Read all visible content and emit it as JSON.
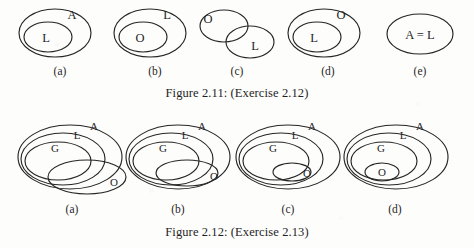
{
  "page": {
    "background_color": "#fdfdfc",
    "ink_color": "#262626"
  },
  "figures": [
    {
      "id": "figure-2-11",
      "caption": "Figure 2.11: (Exercise 2.12)",
      "panels": [
        {
          "label": "(a)",
          "label_x": 60,
          "description": "L inside A",
          "sets": [
            {
              "name": "A",
              "text": "A",
              "cx": 55,
              "cy": 33,
              "rx": 36,
              "ry": 24,
              "label_x": 72,
              "label_y": 19
            },
            {
              "name": "L",
              "text": "L",
              "cx": 48,
              "cy": 37,
              "rx": 24,
              "ry": 15,
              "label_x": 46,
              "label_y": 42
            }
          ]
        },
        {
          "label": "(b)",
          "label_x": 155,
          "description": "O inside L",
          "sets": [
            {
              "name": "L",
              "text": "L",
              "cx": 150,
              "cy": 33,
              "rx": 36,
              "ry": 24,
              "label_x": 167,
              "label_y": 19
            },
            {
              "name": "O",
              "text": "O",
              "cx": 143,
              "cy": 37,
              "rx": 24,
              "ry": 15,
              "label_x": 140,
              "label_y": 42
            }
          ]
        },
        {
          "label": "(c)",
          "label_x": 237,
          "description": "O and L overlapping",
          "sets": [
            {
              "name": "O",
              "text": "O",
              "cx": 224,
              "cy": 26,
              "rx": 24,
              "ry": 16,
              "label_x": 208,
              "label_y": 23
            },
            {
              "name": "L",
              "text": "L",
              "cx": 250,
              "cy": 42,
              "rx": 24,
              "ry": 16,
              "label_x": 255,
              "label_y": 50
            }
          ]
        },
        {
          "label": "(d)",
          "label_x": 328,
          "description": "L inside O",
          "sets": [
            {
              "name": "O",
              "text": "O",
              "cx": 324,
              "cy": 33,
              "rx": 36,
              "ry": 24,
              "label_x": 341,
              "label_y": 19
            },
            {
              "name": "L",
              "text": "L",
              "cx": 317,
              "cy": 37,
              "rx": 24,
              "ry": 15,
              "label_x": 314,
              "label_y": 42
            }
          ]
        },
        {
          "label": "(e)",
          "label_x": 420,
          "description": "single set labelled A = L",
          "sets": [
            {
              "name": "A=L",
              "text": "A = L",
              "cx": 420,
              "cy": 34,
              "rx": 33,
              "ry": 20,
              "label_x": 420,
              "label_y": 39
            }
          ]
        }
      ]
    },
    {
      "id": "figure-2-12",
      "caption": "Figure 2.12: (Exercise 2.13)",
      "panels": [
        {
          "label": "(a)",
          "label_x": 72,
          "description": "G inside L inside A; O overlaps all and extends outside A",
          "sets": [
            {
              "name": "A",
              "text": "A",
              "cx": 70,
              "cy": 157,
              "rx": 52,
              "ry": 32,
              "label_x": 94,
              "label_y": 130
            },
            {
              "name": "L",
              "text": "L",
              "cx": 63,
              "cy": 159,
              "rx": 42,
              "ry": 26,
              "label_x": 77,
              "label_y": 139
            },
            {
              "name": "G",
              "text": "G",
              "cx": 58,
              "cy": 161,
              "rx": 33,
              "ry": 19,
              "label_x": 55,
              "label_y": 152
            },
            {
              "name": "O",
              "text": "O",
              "cx": 87,
              "cy": 177,
              "rx": 39,
              "ry": 17,
              "label_x": 114,
              "label_y": 186
            }
          ]
        },
        {
          "label": "(b)",
          "label_x": 178,
          "description": "G inside L inside A; O inside A overlapping L and G",
          "sets": [
            {
              "name": "A",
              "text": "A",
              "cx": 178,
              "cy": 157,
              "rx": 52,
              "ry": 32,
              "label_x": 202,
              "label_y": 130
            },
            {
              "name": "L",
              "text": "L",
              "cx": 171,
              "cy": 159,
              "rx": 42,
              "ry": 26,
              "label_x": 185,
              "label_y": 139
            },
            {
              "name": "G",
              "text": "G",
              "cx": 166,
              "cy": 161,
              "rx": 33,
              "ry": 19,
              "label_x": 163,
              "label_y": 152
            },
            {
              "name": "O",
              "text": "O",
              "cx": 187,
              "cy": 173,
              "rx": 31,
              "ry": 13,
              "label_x": 214,
              "label_y": 180
            }
          ]
        },
        {
          "label": "(c)",
          "label_x": 288,
          "description": "G inside L inside A; O inside L overlapping G",
          "sets": [
            {
              "name": "A",
              "text": "A",
              "cx": 288,
              "cy": 157,
              "rx": 52,
              "ry": 32,
              "label_x": 312,
              "label_y": 130
            },
            {
              "name": "L",
              "text": "L",
              "cx": 281,
              "cy": 159,
              "rx": 42,
              "ry": 26,
              "label_x": 295,
              "label_y": 139
            },
            {
              "name": "G",
              "text": "G",
              "cx": 276,
              "cy": 161,
              "rx": 33,
              "ry": 19,
              "label_x": 273,
              "label_y": 152
            },
            {
              "name": "O",
              "text": "O",
              "cx": 292,
              "cy": 172,
              "rx": 19,
              "ry": 9,
              "label_x": 307,
              "label_y": 177
            }
          ]
        },
        {
          "label": "(d)",
          "label_x": 395,
          "description": "O inside G inside L inside A",
          "sets": [
            {
              "name": "A",
              "text": "A",
              "cx": 396,
              "cy": 157,
              "rx": 52,
              "ry": 32,
              "label_x": 420,
              "label_y": 130
            },
            {
              "name": "L",
              "text": "L",
              "cx": 389,
              "cy": 159,
              "rx": 42,
              "ry": 26,
              "label_x": 403,
              "label_y": 139
            },
            {
              "name": "G",
              "text": "G",
              "cx": 384,
              "cy": 161,
              "rx": 33,
              "ry": 19,
              "label_x": 381,
              "label_y": 152
            },
            {
              "name": "O",
              "text": "O",
              "cx": 382,
              "cy": 172,
              "rx": 17,
              "ry": 9,
              "label_x": 382,
              "label_y": 176
            }
          ]
        }
      ]
    }
  ]
}
